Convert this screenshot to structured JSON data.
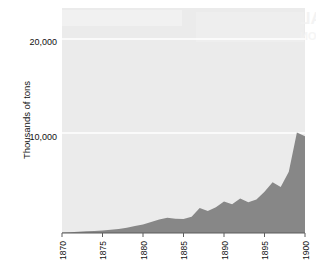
{
  "chart_data": {
    "type": "area",
    "title": "",
    "subtitle": "",
    "xlabel": "",
    "ylabel": "Thousands of tons",
    "xlim": [
      1870,
      1900
    ],
    "ylim": [
      0,
      23500
    ],
    "grid": true,
    "grid_color": "#ffffff",
    "legend": null,
    "plot_background": "#ebebeb",
    "area_color": "#878787",
    "x_tick_labels": [
      "1870",
      "1875",
      "1880",
      "1885",
      "1890",
      "1895",
      "1900"
    ],
    "x_ticks": [
      1870,
      1875,
      1880,
      1885,
      1890,
      1895,
      1900
    ],
    "y_tick_labels": [
      "10,000",
      "20,000"
    ],
    "y_ticks": [
      10000,
      20000
    ],
    "x": [
      1870,
      1871,
      1872,
      1873,
      1874,
      1875,
      1876,
      1877,
      1878,
      1879,
      1880,
      1881,
      1882,
      1883,
      1884,
      1885,
      1886,
      1887,
      1888,
      1889,
      1890,
      1891,
      1892,
      1893,
      1894,
      1895,
      1896,
      1897,
      1898,
      1899,
      1900
    ],
    "values": [
      60,
      90,
      130,
      170,
      210,
      260,
      330,
      430,
      560,
      720,
      900,
      1150,
      1400,
      1600,
      1500,
      1450,
      1700,
      2600,
      2300,
      2700,
      3300,
      3000,
      3600,
      3200,
      3500,
      4300,
      5300,
      4800,
      6400,
      10500,
      10100
    ],
    "series": [
      {
        "name": "Output",
        "values": [
          60,
          90,
          130,
          170,
          210,
          260,
          330,
          430,
          560,
          720,
          900,
          1150,
          1400,
          1600,
          1500,
          1450,
          1700,
          2600,
          2300,
          2700,
          3300,
          3000,
          3600,
          3200,
          3500,
          4300,
          5300,
          4800,
          6400,
          10500,
          10100
        ]
      }
    ],
    "annotations": []
  },
  "watermark": {
    "line1": "LOCAL",
    "line2": "DISTRIBUTION"
  }
}
